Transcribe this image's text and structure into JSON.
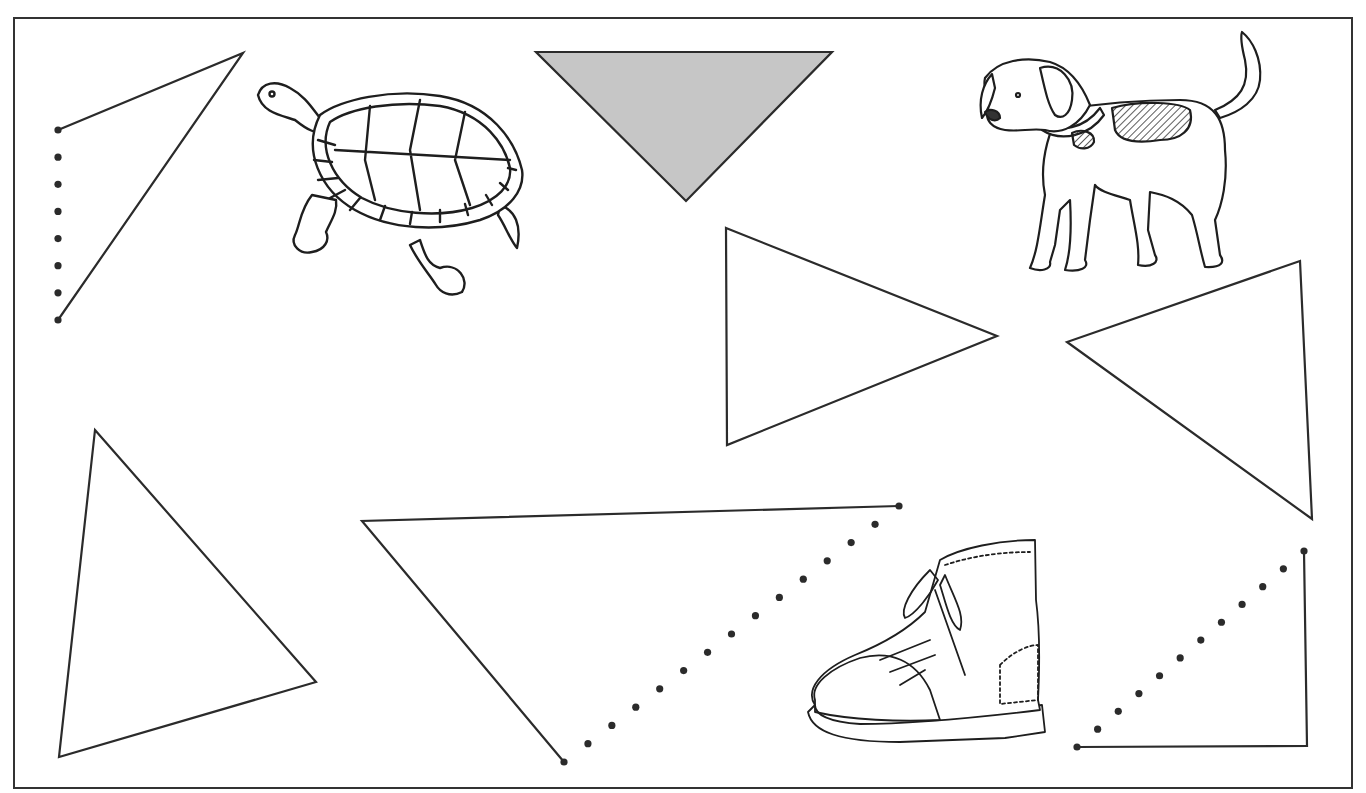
{
  "worksheet": {
    "frame": {
      "x": 14,
      "y": 18,
      "width": 1338,
      "height": 770,
      "stroke": "#333333"
    },
    "ink_color": "#2b2b2b",
    "fill_gray": "#c6c6c6",
    "shapes": [
      {
        "name": "triangle-incomplete-top-left",
        "kind": "dotted-triangle",
        "solid": [
          [
            58,
            130
          ],
          [
            243,
            53
          ],
          [
            58,
            320
          ]
        ],
        "dots_from": [
          58,
          130
        ],
        "dots_to": [
          58,
          320
        ],
        "dot_count": 8
      },
      {
        "name": "triangle-shaded-top",
        "kind": "filled-triangle",
        "points": [
          [
            536,
            52
          ],
          [
            832,
            52
          ],
          [
            686,
            201
          ]
        ]
      },
      {
        "name": "triangle-pointing-right",
        "kind": "triangle",
        "points": [
          [
            726,
            228
          ],
          [
            997,
            336
          ],
          [
            727,
            445
          ]
        ]
      },
      {
        "name": "triangle-pointing-left",
        "kind": "triangle",
        "points": [
          [
            1300,
            261
          ],
          [
            1067,
            342
          ],
          [
            1312,
            519
          ]
        ]
      },
      {
        "name": "triangle-bottom-left",
        "kind": "triangle",
        "points": [
          [
            95,
            430
          ],
          [
            316,
            682
          ],
          [
            59,
            757
          ]
        ]
      },
      {
        "name": "triangle-incomplete-bottom-middle",
        "kind": "dotted-triangle",
        "solid": [
          [
            899,
            506
          ],
          [
            362,
            521
          ],
          [
            564,
            762
          ]
        ],
        "dots_from": [
          564,
          762
        ],
        "dots_to": [
          899,
          506
        ],
        "dot_count": 15
      },
      {
        "name": "triangle-incomplete-bottom-right",
        "kind": "dotted-triangle",
        "solid": [
          [
            1304,
            551
          ],
          [
            1307,
            746
          ],
          [
            1077,
            747
          ]
        ],
        "dots_from": [
          1077,
          747
        ],
        "dots_to": [
          1304,
          551
        ],
        "dot_count": 12
      }
    ],
    "pictures": [
      {
        "name": "turtle-picture",
        "label": "turtle",
        "x": 255,
        "y": 80,
        "width": 270,
        "height": 215
      },
      {
        "name": "dog-picture",
        "label": "dog",
        "x": 978,
        "y": 30,
        "width": 290,
        "height": 245
      },
      {
        "name": "boot-picture",
        "label": "boot",
        "x": 805,
        "y": 540,
        "width": 240,
        "height": 205
      }
    ]
  }
}
